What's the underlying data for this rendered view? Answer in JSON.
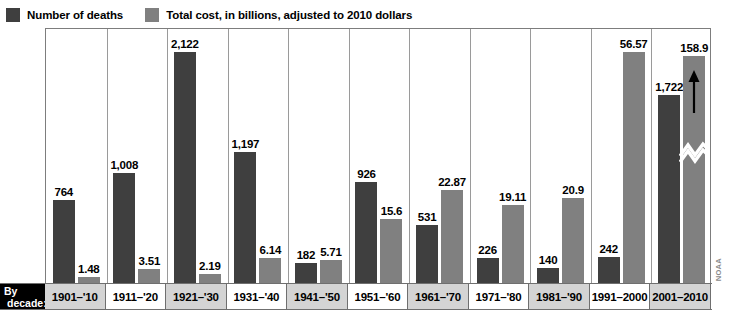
{
  "legend": {
    "entries": [
      {
        "label": "Number of deaths",
        "color": "#3f3f3f",
        "swatch_name": "deaths-swatch"
      },
      {
        "label": "Total cost, in billions, adjusted to 2010 dollars",
        "color": "#808080",
        "swatch_name": "cost-swatch"
      }
    ]
  },
  "axis": {
    "title_line1": "By",
    "title_line2": "decade:"
  },
  "source": "NOAA",
  "chart_data": {
    "type": "bar",
    "title": "",
    "subtitle": "",
    "xlabel": "By decade:",
    "ylabel": "",
    "grid": false,
    "legend_position": "top-left",
    "categories": [
      "1901–'10",
      "1911–'20",
      "1921–'30",
      "1931–'40",
      "1941–'50",
      "1951–'60",
      "1961–'70",
      "1971–'80",
      "1981–'90",
      "1991–2000",
      "2001–2010"
    ],
    "series": [
      {
        "name": "Number of deaths",
        "color": "#3f3f3f",
        "values": [
          764,
          1008,
          2122,
          1197,
          182,
          926,
          531,
          226,
          140,
          242,
          1722
        ],
        "labels": [
          "764",
          "1,008",
          "2,122",
          "1,197",
          "182",
          "926",
          "531",
          "226",
          "140",
          "242",
          "1,722"
        ]
      },
      {
        "name": "Total cost, in billions, adjusted to 2010 dollars",
        "color": "#808080",
        "values": [
          1.48,
          3.51,
          2.19,
          6.14,
          5.71,
          15.6,
          22.87,
          19.11,
          20.9,
          56.57,
          158.9
        ],
        "labels": [
          "1.48",
          "3.51",
          "2.19",
          "6.14",
          "5.71",
          "15.6",
          "22.87",
          "19.11",
          "20.9",
          "56.57",
          "158.9"
        ],
        "truncated_index": 10,
        "truncated_note": "bar broken with zigzag and up-arrow; value exceeds plot scale"
      }
    ],
    "deaths_axis_max": 2320,
    "cost_axis_max": 62,
    "annotations": [
      {
        "type": "axis-break",
        "category": "2001–2010",
        "series": "Total cost, in billions, adjusted to 2010 dollars"
      },
      {
        "type": "up-arrow",
        "category": "2001–2010",
        "series": "Total cost, in billions, adjusted to 2010 dollars"
      }
    ]
  }
}
